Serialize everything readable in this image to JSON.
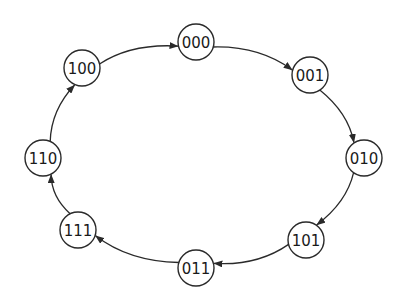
{
  "diagram": {
    "type": "state-cycle",
    "colors": {
      "stroke": "#2a2a2a",
      "text": "#1a1a1a",
      "background": "#ffffff"
    },
    "nodes": [
      {
        "id": "000",
        "label": "000",
        "x": 196,
        "y": 42
      },
      {
        "id": "001",
        "label": "001",
        "x": 310,
        "y": 75
      },
      {
        "id": "010",
        "label": "010",
        "x": 364,
        "y": 158
      },
      {
        "id": "101",
        "label": "101",
        "x": 306,
        "y": 240
      },
      {
        "id": "011",
        "label": "011",
        "x": 196,
        "y": 268
      },
      {
        "id": "111",
        "label": "111",
        "x": 78,
        "y": 230
      },
      {
        "id": "110",
        "label": "110",
        "x": 43,
        "y": 158
      },
      {
        "id": "100",
        "label": "100",
        "x": 82,
        "y": 68
      }
    ],
    "edges": [
      {
        "from": "000",
        "to": "001"
      },
      {
        "from": "001",
        "to": "010"
      },
      {
        "from": "010",
        "to": "101"
      },
      {
        "from": "101",
        "to": "011"
      },
      {
        "from": "011",
        "to": "111"
      },
      {
        "from": "111",
        "to": "110"
      },
      {
        "from": "110",
        "to": "100"
      },
      {
        "from": "100",
        "to": "000"
      }
    ],
    "node_radius": 18,
    "center": {
      "x": 203,
      "y": 155
    }
  }
}
